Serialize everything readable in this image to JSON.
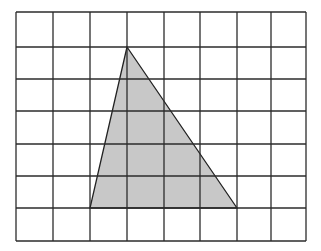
{
  "diagram": {
    "type": "grid-with-triangle",
    "grid": {
      "columns": 8,
      "rows": 7,
      "left": 16,
      "top": 12,
      "col_lines": [
        16,
        53,
        90,
        127,
        164,
        200,
        237,
        271,
        306
      ],
      "row_lines": [
        12,
        47,
        79,
        111,
        144,
        176,
        208,
        241
      ],
      "line_color": "#2b2b2b",
      "line_width": 1.3
    },
    "triangle": {
      "vertices_grid": [
        [
          3,
          1
        ],
        [
          2,
          6
        ],
        [
          6,
          6
        ]
      ],
      "fill_color": "#c8c8c8",
      "stroke_color": "#222222",
      "stroke_width": 1.3
    },
    "background_color": "#ffffff"
  }
}
